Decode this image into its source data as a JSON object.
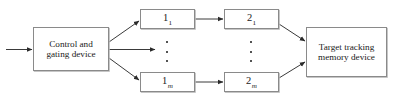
{
  "diagram": {
    "background_color": "#ffffff",
    "line_color": "#3a3a3a",
    "box_border_color": "#8a8a8a",
    "box_shadow_color": "#b9b9b9",
    "text_color": "#1a1a1a",
    "nodes": [
      {
        "id": "control-gating-device",
        "label": "Control and\ngating device",
        "line1": "Control and",
        "line2": "gating device",
        "x": 33,
        "y": 27,
        "width": 76,
        "height": 44
      },
      {
        "id": "stage-1-channel-1",
        "label": "1",
        "subscript": "1",
        "subscript_italic": false,
        "x": 140,
        "y": 9,
        "width": 55,
        "height": 20
      },
      {
        "id": "stage-1-channel-m",
        "label": "1",
        "subscript": "m",
        "subscript_italic": true,
        "x": 140,
        "y": 72,
        "width": 55,
        "height": 20
      },
      {
        "id": "stage-2-channel-1",
        "label": "2",
        "subscript": "1",
        "subscript_italic": false,
        "x": 224,
        "y": 9,
        "width": 55,
        "height": 20
      },
      {
        "id": "stage-2-channel-m",
        "label": "2",
        "subscript": "m",
        "subscript_italic": true,
        "x": 224,
        "y": 72,
        "width": 55,
        "height": 20
      },
      {
        "id": "target-tracking-memory-device",
        "label": "Target tracking\nmemory device",
        "line1": "Target tracking",
        "line2": "memory device",
        "x": 306,
        "y": 27,
        "width": 81,
        "height": 50
      }
    ],
    "ellipses": [
      {
        "id": "ellipsis-stage-1",
        "x": 163,
        "y": 41,
        "dots": 3
      },
      {
        "id": "ellipsis-stage-2",
        "x": 247,
        "y": 41,
        "dots": 3
      }
    ],
    "connections": [
      {
        "id": "input-to-control",
        "from": "external-input",
        "to": "control-gating-device",
        "style": "straight"
      },
      {
        "id": "control-to-stage-1-channel-1",
        "from": "control-gating-device",
        "to": "stage-1-channel-1",
        "style": "diagonal-up"
      },
      {
        "id": "control-to-ellipsis-stage-1",
        "from": "control-gating-device",
        "to": "ellipsis-stage-1",
        "style": "straight"
      },
      {
        "id": "control-to-stage-1-channel-m",
        "from": "control-gating-device",
        "to": "stage-1-channel-m",
        "style": "diagonal-down"
      },
      {
        "id": "stage-1-channel-1-to-stage-2-channel-1",
        "from": "stage-1-channel-1",
        "to": "stage-2-channel-1",
        "style": "straight"
      },
      {
        "id": "stage-1-channel-m-to-stage-2-channel-m",
        "from": "stage-1-channel-m",
        "to": "stage-2-channel-m",
        "style": "straight"
      },
      {
        "id": "stage-2-channel-1-to-memory",
        "from": "stage-2-channel-1",
        "to": "target-tracking-memory-device",
        "style": "diagonal-down"
      },
      {
        "id": "stage-2-channel-m-to-memory",
        "from": "stage-2-channel-m",
        "to": "target-tracking-memory-device",
        "style": "diagonal-up"
      }
    ]
  }
}
